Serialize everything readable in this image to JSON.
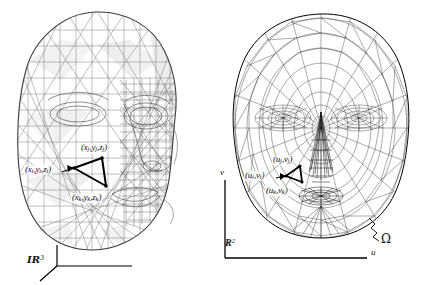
{
  "figure": {
    "width": 434,
    "height": 285,
    "background_color": "#ffffff",
    "ink_color": "#111111",
    "mesh_color": "#555555"
  },
  "left_panel": {
    "name": "3d-face-mesh",
    "description": "Triangulated three-dimensional face surface shown in three-quarter view",
    "space_label": "IR",
    "space_superscript": "3",
    "triangle": {
      "vertex_i": "(x",
      "vertex_i_sub": "i",
      "vertex_i_mid": ",y",
      "vertex_i_sub2": "i",
      "vertex_i_end": ",z",
      "vertex_i_sub3": "i",
      "vertex_i_close": ")"
    },
    "labels": {
      "vertex_j": "(xⱼ,yⱼ,zⱼ)",
      "vertex_i": "(xᵢ,yᵢ,zᵢ)",
      "vertex_k": "(xₖ,yₖ,zₖ)"
    },
    "vertex_j_parts": {
      "p1": "(x",
      "s1": "j",
      "p2": ",y",
      "s2": "j",
      "p3": ",z",
      "s3": "j",
      "p4": ")"
    },
    "vertex_i_parts": {
      "p1": "(x",
      "s1": "i",
      "p2": ",y",
      "s2": "i",
      "p3": ",z",
      "s3": "i",
      "p4": ")"
    },
    "vertex_k_parts": {
      "p1": "(x",
      "s1": "k",
      "p2": ",y",
      "s2": "k",
      "p3": ",z",
      "s3": "k",
      "p4": ")"
    },
    "axis_type": "3d-triad"
  },
  "right_panel": {
    "name": "2d-parametrization-mesh",
    "description": "Planar triangulated parametrization of the face mesh over the domain Omega",
    "space_label": "R",
    "space_superscript": "2",
    "domain_label": "Ω",
    "axis_u": "u",
    "axis_v": "v",
    "labels": {
      "vertex_j": "(uⱼ,vⱼ)",
      "vertex_i": "(uᵢ,vᵢ)",
      "vertex_k": "(uₖ,vₖ)"
    },
    "vertex_j_parts": {
      "p1": "(u",
      "s1": "j",
      "p2": ",v",
      "s2": "j",
      "p3": ")"
    },
    "vertex_i_parts": {
      "p1": "(u",
      "s1": "i",
      "p2": ",v",
      "s2": "i",
      "p3": ")"
    },
    "vertex_k_parts": {
      "p1": "(u",
      "s1": "k",
      "p2": ",v",
      "s2": "k",
      "p3": ")"
    },
    "axis_type": "2d-cartesian"
  }
}
